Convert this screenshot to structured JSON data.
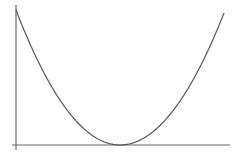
{
  "diagram": {
    "type": "parabola",
    "stroke_color": "#555555",
    "axis_color": "#666666",
    "background": "#ffffff",
    "labels": []
  },
  "chart_data": {
    "type": "line",
    "title": "",
    "xlabel": "",
    "ylabel": "",
    "function": "y = a(x - h)^2",
    "vertex": {
      "x": 120,
      "y": 145
    },
    "left_endpoint": {
      "x": 16,
      "y": 10
    },
    "right_endpoint": {
      "x": 224,
      "y": 13
    },
    "axes": {
      "y_axis_x": 16,
      "x_axis_y": 145,
      "x_axis_start": 12,
      "x_axis_end": 230,
      "y_axis_top": 5,
      "y_axis_bottom": 150
    },
    "grid": false,
    "legend": null
  }
}
